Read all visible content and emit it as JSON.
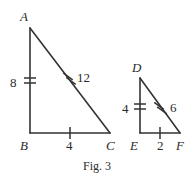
{
  "figure": {
    "caption": "Fig. 3",
    "background_color": "#ffffff",
    "stroke_color": "#333333",
    "text_color": "#2b2b2b",
    "triangles": [
      {
        "name": "large-triangle",
        "vertices": [
          {
            "label": "A",
            "x": 30,
            "y": 28,
            "label_x": 20,
            "label_y": 10
          },
          {
            "label": "B",
            "x": 30,
            "y": 133,
            "label_x": 20,
            "label_y": 139
          },
          {
            "label": "C",
            "x": 110,
            "y": 133,
            "label_x": 106,
            "label_y": 139
          }
        ],
        "sides": [
          {
            "name": "side-AB",
            "measure": "8",
            "ticks": 2,
            "label_x": 10,
            "label_y": 76
          },
          {
            "name": "side-BC",
            "measure": "4",
            "ticks": 1,
            "label_x": 66,
            "label_y": 139
          },
          {
            "name": "side-AC",
            "measure": "12",
            "ticks": 2,
            "label_x": 77,
            "label_y": 71
          }
        ]
      },
      {
        "name": "small-triangle",
        "vertices": [
          {
            "label": "D",
            "x": 140,
            "y": 78,
            "label_x": 132,
            "label_y": 61
          },
          {
            "label": "E",
            "x": 140,
            "y": 133,
            "label_x": 130,
            "label_y": 139
          },
          {
            "label": "F",
            "x": 180,
            "y": 133,
            "label_x": 176,
            "label_y": 139
          }
        ],
        "sides": [
          {
            "name": "side-DE",
            "measure": "4",
            "ticks": 2,
            "label_x": 122,
            "label_y": 102
          },
          {
            "name": "side-EF",
            "measure": "2",
            "ticks": 1,
            "label_x": 157,
            "label_y": 139
          },
          {
            "name": "side-DF",
            "measure": "6",
            "ticks": 2,
            "label_x": 170,
            "label_y": 101
          }
        ]
      }
    ]
  }
}
